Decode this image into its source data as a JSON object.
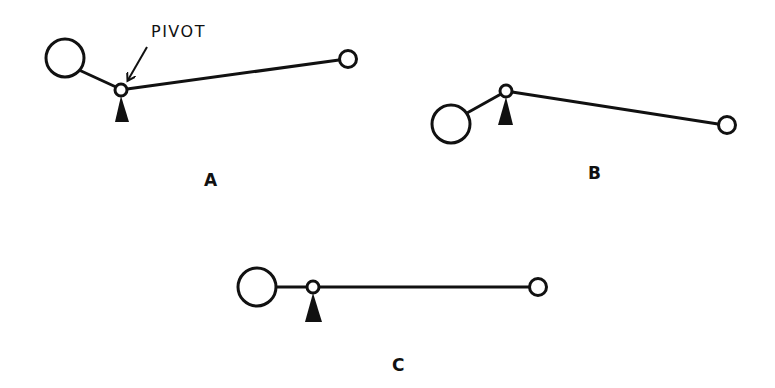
{
  "diagram": {
    "callout_text": "PIVOT",
    "panels": [
      {
        "id": "A",
        "label": "A",
        "description": "Lever tilted with long arm raised; heavy weight on short arm, light weight on long arm"
      },
      {
        "id": "B",
        "label": "B",
        "description": "Lever tilted with long arm lowered; heavy weight on short arm below pivot"
      },
      {
        "id": "C",
        "label": "C",
        "description": "Lever balanced horizontally"
      }
    ],
    "elements": {
      "heavy_weight": "large circle",
      "light_weight": "small circle",
      "pivot": "small ring on triangular fulcrum"
    },
    "colors": {
      "ink": "#111111",
      "background": "#ffffff"
    }
  }
}
